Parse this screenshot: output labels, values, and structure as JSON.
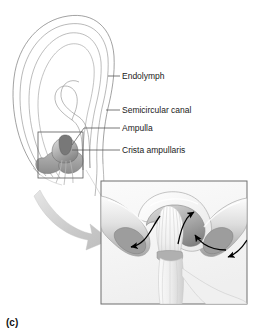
{
  "figure": {
    "panel_letter": "(c)",
    "labels": [
      {
        "id": "endolymph",
        "text": "Endolymph"
      },
      {
        "id": "semicircular-canal",
        "text": "Semicircular canal"
      },
      {
        "id": "ampulla",
        "text": "Ampulla"
      },
      {
        "id": "crista-ampullaris",
        "text": "Crista ampullaris"
      }
    ],
    "colors": {
      "background": "#ffffff",
      "outline": "#6b6b6b",
      "label_text": "#1a1a1a",
      "leader_line": "#555555",
      "tissue_light": "#f2f2f2",
      "tissue_mid": "#b9b9b9",
      "tissue_dark": "#8f8f8f",
      "crista_dark": "#6f6f6f",
      "flow_arrow": "#000000",
      "magnify_arrow": "#cfcfcf",
      "inset_border": "#777777"
    },
    "inset": {
      "name": "magnified-ampulla-inset",
      "description": "Magnified cross-section of the ampulla showing the crista ampullaris, cupula and endolymph flow arrows"
    },
    "detail_box": {
      "name": "ampulla-detail-box",
      "description": "Reference rectangle around the ampulla region of the canal"
    },
    "magnifier_arrow": {
      "name": "magnify-arrow",
      "description": "Curved arrow linking the detail box to the magnified inset"
    },
    "flow_arrows": [
      {
        "id": "flow-left-outward",
        "description": "Endolymph flow arrow curving left and down"
      },
      {
        "id": "flow-center-up",
        "description": "Endolymph flow arrow curving up at center of cupula"
      },
      {
        "id": "flow-right-inward",
        "description": "Endolymph flow arrow curving right toward cupula"
      },
      {
        "id": "flow-right-outward",
        "description": "Endolymph flow arrow along right canal limb"
      }
    ]
  }
}
